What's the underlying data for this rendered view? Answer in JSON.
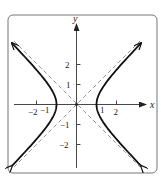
{
  "figure": {
    "type": "hyperbola",
    "equation": "x^2 - y^2 = 1",
    "x_axis_label": "x",
    "y_axis_label": "y",
    "x_ticks": [
      {
        "value": -2,
        "label": "−2"
      },
      {
        "value": -1,
        "label": "−1"
      },
      {
        "value": 1,
        "label": "1"
      },
      {
        "value": 2,
        "label": "2"
      }
    ],
    "y_ticks": [
      {
        "value": 2,
        "label": "2"
      },
      {
        "value": 1,
        "label": "1"
      },
      {
        "value": -1,
        "label": "−1"
      },
      {
        "value": -2,
        "label": "−2"
      }
    ],
    "asymptotes": [
      "y = x",
      "y = -x"
    ],
    "vertices": [
      [
        -1,
        0
      ],
      [
        1,
        0
      ]
    ],
    "center": [
      0,
      0
    ],
    "colors": {
      "curve": "#111111",
      "axes": "#333333",
      "asymptote": "#888888",
      "frame": "#777777"
    }
  }
}
